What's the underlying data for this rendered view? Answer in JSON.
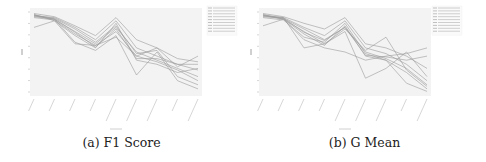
{
  "figure": {
    "subfigures": [
      {
        "id": "a",
        "caption": "(a) F1 Score"
      },
      {
        "id": "b",
        "caption": "(b) G Mean"
      }
    ]
  },
  "chart_data": [
    {
      "type": "line",
      "title": "(a) F1 Score",
      "xlabel": "",
      "ylabel": "",
      "categories": [
        "",
        "",
        "",
        "",
        "",
        "",
        "",
        "",
        ""
      ],
      "ylim": [
        0,
        1
      ],
      "grid": false,
      "legend_position": "right-outside",
      "series": [
        {
          "name": "",
          "values": [
            0.95,
            0.9,
            0.62,
            0.52,
            0.7,
            0.22,
            0.5,
            0.15,
            0.05
          ]
        },
        {
          "name": "",
          "values": [
            0.96,
            0.88,
            0.7,
            0.55,
            0.85,
            0.4,
            0.35,
            0.25,
            0.3
          ]
        },
        {
          "name": "",
          "values": [
            0.93,
            0.9,
            0.75,
            0.6,
            0.8,
            0.5,
            0.4,
            0.3,
            0.2
          ]
        },
        {
          "name": "",
          "values": [
            0.94,
            0.92,
            0.8,
            0.65,
            0.88,
            0.55,
            0.45,
            0.35,
            0.28
          ]
        },
        {
          "name": "",
          "values": [
            0.92,
            0.89,
            0.72,
            0.58,
            0.75,
            0.45,
            0.38,
            0.28,
            0.15
          ]
        },
        {
          "name": "",
          "values": [
            0.97,
            0.93,
            0.82,
            0.7,
            0.92,
            0.65,
            0.55,
            0.42,
            0.38
          ]
        },
        {
          "name": "",
          "values": [
            0.95,
            0.91,
            0.78,
            0.62,
            0.82,
            0.48,
            0.52,
            0.2,
            0.1
          ]
        },
        {
          "name": "",
          "values": [
            0.8,
            0.88,
            0.6,
            0.58,
            0.68,
            0.45,
            0.55,
            0.32,
            0.45
          ]
        },
        {
          "name": "",
          "values": [
            0.94,
            0.9,
            0.74,
            0.56,
            0.78,
            0.42,
            0.42,
            0.35,
            0.35
          ]
        }
      ]
    },
    {
      "type": "line",
      "title": "(b) G Mean",
      "xlabel": "",
      "ylabel": "",
      "categories": [
        "",
        "",
        "",
        "",
        "",
        "",
        "",
        "",
        ""
      ],
      "ylim": [
        0,
        1
      ],
      "grid": false,
      "legend_position": "right-outside",
      "series": [
        {
          "name": "",
          "values": [
            0.95,
            0.92,
            0.55,
            0.6,
            0.75,
            0.18,
            0.3,
            0.5,
            0.2
          ]
        },
        {
          "name": "",
          "values": [
            0.96,
            0.9,
            0.72,
            0.58,
            0.82,
            0.45,
            0.4,
            0.25,
            0.05
          ]
        },
        {
          "name": "",
          "values": [
            0.93,
            0.91,
            0.78,
            0.65,
            0.8,
            0.5,
            0.42,
            0.3,
            0.1
          ]
        },
        {
          "name": "",
          "values": [
            0.94,
            0.92,
            0.8,
            0.7,
            0.88,
            0.55,
            0.48,
            0.35,
            0.15
          ]
        },
        {
          "name": "",
          "values": [
            0.92,
            0.89,
            0.68,
            0.62,
            0.85,
            0.48,
            0.4,
            0.12,
            0.02
          ]
        },
        {
          "name": "",
          "values": [
            0.97,
            0.93,
            0.85,
            0.78,
            0.92,
            0.6,
            0.55,
            0.45,
            0.3
          ]
        },
        {
          "name": "",
          "values": [
            0.95,
            0.9,
            0.75,
            0.6,
            0.78,
            0.52,
            0.68,
            0.28,
            0.08
          ]
        },
        {
          "name": "",
          "values": [
            0.82,
            0.9,
            0.65,
            0.55,
            0.5,
            0.4,
            0.45,
            0.48,
            0.55
          ]
        },
        {
          "name": "",
          "values": [
            0.94,
            0.91,
            0.74,
            0.64,
            0.8,
            0.46,
            0.44,
            0.4,
            0.45
          ]
        }
      ]
    }
  ]
}
